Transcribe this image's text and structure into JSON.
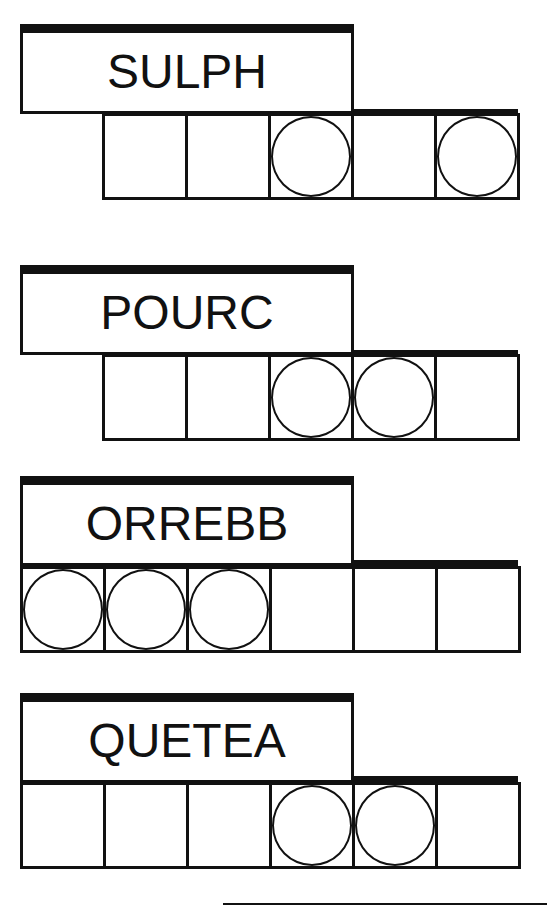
{
  "puzzles": [
    {
      "scrambled": "SULPH",
      "cells": 5,
      "circled": [
        3,
        5
      ]
    },
    {
      "scrambled": "POURC",
      "cells": 5,
      "circled": [
        3,
        4
      ]
    },
    {
      "scrambled": "ORREBB",
      "cells": 6,
      "circled": [
        1,
        2,
        3
      ]
    },
    {
      "scrambled": "QUETEA",
      "cells": 6,
      "circled": [
        4,
        5
      ]
    }
  ],
  "colors": {
    "ink": "#111111",
    "background": "#ffffff"
  }
}
